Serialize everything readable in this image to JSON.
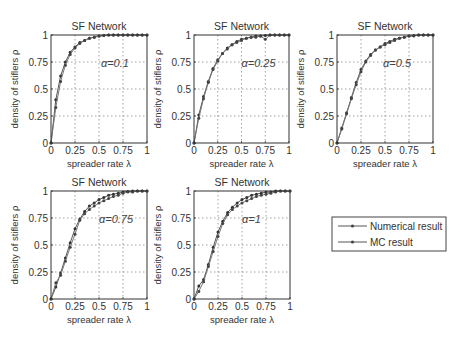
{
  "figure": {
    "legend": {
      "entries": [
        "Numerical result",
        "MC result"
      ]
    }
  },
  "chart_data": [
    {
      "type": "line",
      "title": "SF Network",
      "xlabel": "spreader rate λ",
      "ylabel": "density of stiflers ρ",
      "annotation": "α=0.1",
      "xlim": [
        0,
        1
      ],
      "ylim": [
        0,
        1
      ],
      "xticks": [
        "0",
        "0.25",
        "0.5",
        "0.75",
        "1"
      ],
      "yticks": [
        "0",
        "0.25",
        "0.5",
        "0.75",
        "1"
      ],
      "grid": true,
      "x": [
        0,
        0.05,
        0.1,
        0.15,
        0.2,
        0.25,
        0.3,
        0.35,
        0.4,
        0.45,
        0.5,
        0.55,
        0.6,
        0.65,
        0.7,
        0.75,
        0.8,
        0.85,
        0.9,
        0.95,
        1
      ],
      "series": [
        {
          "name": "Numerical result",
          "values": [
            0,
            0.4,
            0.62,
            0.75,
            0.84,
            0.89,
            0.93,
            0.95,
            0.97,
            0.98,
            0.99,
            0.995,
            1,
            1,
            1,
            1,
            1,
            1,
            1,
            1,
            1
          ]
        },
        {
          "name": "MC result",
          "values": [
            0,
            0.33,
            0.57,
            0.72,
            0.82,
            0.88,
            0.92,
            0.95,
            0.97,
            0.98,
            0.99,
            0.995,
            1,
            1,
            1,
            1,
            1,
            1,
            1,
            1,
            1
          ]
        }
      ]
    },
    {
      "type": "line",
      "title": "SF Network",
      "xlabel": "spreader rate λ",
      "ylabel": "density of stiflers ρ",
      "annotation": "α=0.25",
      "xlim": [
        0,
        1
      ],
      "ylim": [
        0,
        1
      ],
      "xticks": [
        "0",
        "0.25",
        "0.5",
        "0.75",
        "1"
      ],
      "yticks": [
        "0",
        "0.25",
        "0.5",
        "0.75",
        "1"
      ],
      "grid": true,
      "x": [
        0,
        0.05,
        0.1,
        0.15,
        0.2,
        0.25,
        0.3,
        0.35,
        0.4,
        0.45,
        0.5,
        0.55,
        0.6,
        0.65,
        0.7,
        0.75,
        0.8,
        0.85,
        0.9,
        0.95,
        1
      ],
      "series": [
        {
          "name": "Numerical result",
          "values": [
            0,
            0.26,
            0.43,
            0.57,
            0.69,
            0.77,
            0.83,
            0.88,
            0.91,
            0.94,
            0.96,
            0.97,
            0.98,
            0.99,
            0.99,
            0.995,
            1,
            1,
            1,
            1,
            1
          ]
        },
        {
          "name": "MC result",
          "values": [
            0,
            0.23,
            0.41,
            0.56,
            0.68,
            0.76,
            0.83,
            0.87,
            0.91,
            0.93,
            0.95,
            0.97,
            0.98,
            0.98,
            0.99,
            0.96,
            1,
            1,
            1,
            1,
            1
          ]
        }
      ]
    },
    {
      "type": "line",
      "title": "SF Network",
      "xlabel": "spreader rate λ",
      "ylabel": "density of stiflers ρ",
      "annotation": "α=0.5",
      "xlim": [
        0,
        1
      ],
      "ylim": [
        0,
        1
      ],
      "xticks": [
        "0",
        "0.25",
        "0.5",
        "0.75",
        "1"
      ],
      "yticks": [
        "0",
        "0.25",
        "0.5",
        "0.75",
        "1"
      ],
      "grid": true,
      "x": [
        0,
        0.05,
        0.1,
        0.15,
        0.2,
        0.25,
        0.3,
        0.35,
        0.4,
        0.45,
        0.5,
        0.55,
        0.6,
        0.65,
        0.7,
        0.75,
        0.8,
        0.85,
        0.9,
        0.95,
        1
      ],
      "series": [
        {
          "name": "Numerical result",
          "values": [
            0,
            0.14,
            0.28,
            0.42,
            0.56,
            0.68,
            0.76,
            0.82,
            0.86,
            0.89,
            0.92,
            0.94,
            0.96,
            0.97,
            0.98,
            0.99,
            0.995,
            1,
            1,
            1,
            1
          ]
        },
        {
          "name": "MC result",
          "values": [
            0,
            0.13,
            0.27,
            0.41,
            0.54,
            0.66,
            0.75,
            0.81,
            0.86,
            0.89,
            0.91,
            0.93,
            0.95,
            0.97,
            0.98,
            0.99,
            0.99,
            1,
            1,
            1,
            1
          ]
        }
      ]
    },
    {
      "type": "line",
      "title": "SF Network",
      "xlabel": "spreader rate λ",
      "ylabel": "density of stiflers ρ",
      "annotation": "α=0.75",
      "xlim": [
        0,
        1
      ],
      "ylim": [
        0,
        1
      ],
      "xticks": [
        "0",
        "0.25",
        "0.5",
        "0.75",
        "1"
      ],
      "yticks": [
        "0",
        "0.25",
        "0.5",
        "0.75",
        "1"
      ],
      "grid": true,
      "x": [
        0,
        0.05,
        0.1,
        0.15,
        0.2,
        0.25,
        0.3,
        0.35,
        0.4,
        0.45,
        0.5,
        0.55,
        0.6,
        0.65,
        0.7,
        0.75,
        0.8,
        0.85,
        0.9,
        0.95,
        1
      ],
      "series": [
        {
          "name": "Numerical result",
          "values": [
            0,
            0.11,
            0.24,
            0.38,
            0.52,
            0.65,
            0.74,
            0.81,
            0.86,
            0.89,
            0.92,
            0.94,
            0.96,
            0.97,
            0.98,
            0.99,
            0.995,
            1,
            1,
            1,
            1
          ]
        },
        {
          "name": "MC result",
          "values": [
            0,
            0.15,
            0.22,
            0.35,
            0.48,
            0.6,
            0.73,
            0.79,
            0.83,
            0.86,
            0.89,
            0.91,
            0.93,
            0.95,
            0.96,
            0.98,
            0.99,
            0.99,
            1,
            1,
            1
          ]
        }
      ]
    },
    {
      "type": "line",
      "title": "SF Network",
      "xlabel": "spreader rate λ",
      "ylabel": "density of stiflers ρ",
      "annotation": "α=1",
      "xlim": [
        0,
        1
      ],
      "ylim": [
        0,
        1
      ],
      "xticks": [
        "0",
        "0.25",
        "0.5",
        "0.75",
        "1"
      ],
      "yticks": [
        "0",
        "0.25",
        "0.5",
        "0.75",
        "1"
      ],
      "grid": true,
      "x": [
        0,
        0.05,
        0.1,
        0.15,
        0.2,
        0.25,
        0.3,
        0.35,
        0.4,
        0.45,
        0.5,
        0.55,
        0.6,
        0.65,
        0.7,
        0.75,
        0.8,
        0.85,
        0.9,
        0.95,
        1
      ],
      "series": [
        {
          "name": "Numerical result",
          "values": [
            0,
            0.12,
            0.18,
            0.32,
            0.48,
            0.62,
            0.72,
            0.8,
            0.85,
            0.89,
            0.92,
            0.94,
            0.96,
            0.97,
            0.98,
            0.99,
            0.99,
            1,
            1,
            1,
            1
          ]
        },
        {
          "name": "MC result",
          "values": [
            0,
            0.07,
            0.16,
            0.3,
            0.44,
            0.58,
            0.7,
            0.78,
            0.83,
            0.86,
            0.89,
            0.91,
            0.93,
            0.95,
            0.96,
            0.97,
            0.98,
            0.99,
            1,
            1,
            1
          ]
        }
      ]
    }
  ]
}
